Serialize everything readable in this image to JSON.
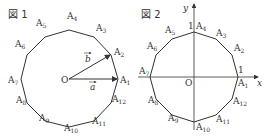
{
  "figure1": {
    "title": "図 1",
    "center_label": "O",
    "vectors": [
      {
        "name": "a",
        "to": "A1"
      },
      {
        "name": "b",
        "to": "A2"
      }
    ],
    "vertex_labels": [
      "A1",
      "A2",
      "A3",
      "A4",
      "A5",
      "A6",
      "A7",
      "A8",
      "A9",
      "A10",
      "A11",
      "A12"
    ]
  },
  "figure2": {
    "title": "図 2",
    "center_label": "O",
    "x_axis_label": "x",
    "y_axis_label": "y",
    "x_tick": "1",
    "y_tick": "1",
    "vertex_labels": [
      "A1",
      "A2",
      "A3",
      "A4",
      "A5",
      "A6",
      "A7",
      "A8",
      "A9",
      "A10",
      "A11",
      "A12"
    ]
  }
}
